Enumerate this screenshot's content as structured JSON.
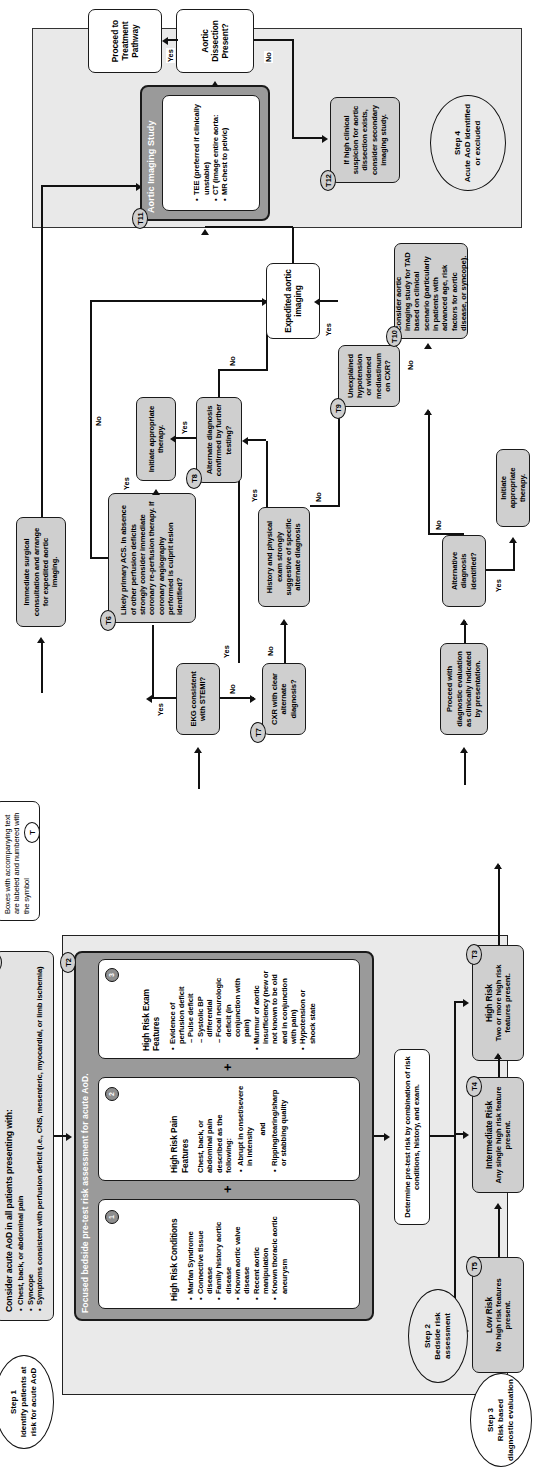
{
  "legend": {
    "text": "Boxes with accompanying text are labeled and numbered with the        symbol",
    "tag": "T"
  },
  "steps": {
    "step1": "Step 1\nIdentify patients at risk for acute AoD",
    "step1_title": "Step 1",
    "step1_sub": "Identify patients at risk for acute AoD",
    "step2_title": "Step 2",
    "step2_sub": "Bedside risk assessment",
    "step3_title": "Step 3",
    "step3_sub": "Risk based diagnostic evaluation",
    "step4_title": "Step 4",
    "step4_sub": "Acute AoD identified or excluded"
  },
  "t1": {
    "tag": "T1",
    "title": "Consider acute AoD in all patients presenting with:",
    "bullets": [
      "Chest, back, or abdominal pain",
      "Syncope",
      "Symptoms consistent with perfusion deficit (i.e., CNS, mesenteric, myocardial, or limb ischemia)"
    ]
  },
  "t2": {
    "tag": "T2",
    "band_title": "Focused bedside pre-test risk assessment for acute AoD."
  },
  "box1": {
    "num": "1",
    "title": "High Risk Conditions",
    "bullets": [
      "Marfan Syndrome",
      "Connective tissue disease",
      "Family history aortic disease",
      "Known aortic valve disease",
      "Recent aortic manipulation",
      "Known thoracic aortic aneurysm"
    ]
  },
  "box2": {
    "num": "2",
    "title": "High Risk Pain Features",
    "lead": "Chest, back, or abdominal pain described as the following:",
    "bullets": [
      "Abrupt in onset/severe in intensity"
    ],
    "conj": "and",
    "bullets2": [
      "Ripping/tearing/sharp or stabbing quality"
    ]
  },
  "box3": {
    "num": "3",
    "title": "High Risk Exam Features",
    "bullets": [
      "Evidence of perfusion deficit",
      "Pulse deficit",
      "Systolic BP differential",
      "Focal neurologic deficit (in conjunction with pain)",
      "Murmur of aortic insufficiency (new or not known to be old and in conjunction with pain)",
      "Hypotension or shock state"
    ]
  },
  "plus": "+",
  "determine": "Determine pre-test risk by combination of risk conditions, history, and exam.",
  "t3": {
    "tag": "T3",
    "title": "High Risk",
    "sub": "Two or more high risk features present."
  },
  "t4": {
    "tag": "T4",
    "title": "Intermediate Risk",
    "sub": "Any single high risk feature present."
  },
  "t5": {
    "tag": "T5",
    "title": "Low Risk",
    "sub": "No high risk features present."
  },
  "right": {
    "immediate_surgical": "Immediate surgical consultation and arrange for expedited aortic imaging.",
    "ekg_stemi": "EKG consistent with STEMI?",
    "t6": {
      "tag": "T6",
      "text": "Likely primary ACS. In absence of other perfusion deficits strongly consider immediate coronary re-perfusion therapy. If coronary angiography performed is culprit lesion identified?"
    },
    "initiate_therapy": "Initiate appropriate therapy.",
    "t7": {
      "tag": "T7",
      "text": "CXR with clear alternate diagnosis?"
    },
    "t8": {
      "tag": "T8",
      "text": "Alternate diagnosis confirmed by further testing?"
    },
    "history_physical": "History and physical exam strongly suggestive of specific alternate diagnosis",
    "t9": {
      "tag": "T9",
      "text": "Unexplained hypotension or widened mediastinum on CXR?"
    },
    "t10": {
      "tag": "T10",
      "text": "Consider aortic imaging study for TAD based on clinical scenario (particularly in patients with advanced age, risk factors for aortic disease, or syncope)."
    },
    "expedited": "Expedited aortic imaging",
    "proceed_diagnostic": "Proceed with diagnostic evaluation as clinically indicated by presentation.",
    "alt_dx_identified": "Alternative diagnosis identified?",
    "initiate_therapy2": "Initiate appropriate therapy.",
    "t11": {
      "tag": "T11",
      "title": "Aortic Imaging Study",
      "bullets": [
        "TEE (preferred if clinically unstable)",
        "CT  (image entire aorta:",
        "MR   chest to pelvic)"
      ]
    },
    "aod_present": "Aortic Dissection Present?",
    "proceed_treatment": "Proceed to Treatment Pathway",
    "t12": {
      "tag": "T12",
      "text": "If high clinical suspicion for aortic dissection exists, consider secondary imaging study."
    }
  },
  "edges": {
    "yes": "Yes",
    "no": "No"
  },
  "colors": {
    "node_fill": "#cfcfcf",
    "node_white": "#ffffff",
    "band_fill": "#9a9a9a",
    "panel_fill": "#eaeaea",
    "stroke": "#1a1a1a"
  }
}
